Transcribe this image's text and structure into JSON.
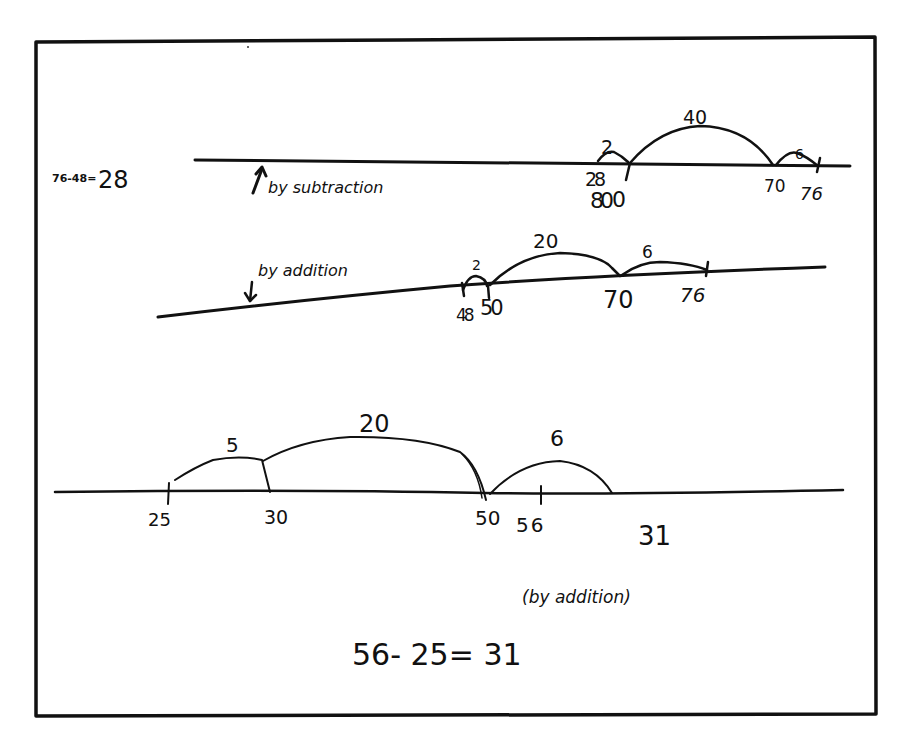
{
  "figure": {
    "frame": {
      "x": 36,
      "y": 40,
      "width": 839,
      "height": 675,
      "stroke_color": "#111111"
    },
    "ink_color": "#111111",
    "background": "#ffffff"
  },
  "section_subtraction": {
    "equation": "76-48=28",
    "equation_left": "76-48=",
    "equation_result": "28",
    "method_label": "by subtraction",
    "arrow": "up-arrow",
    "number_line": {
      "x1": 195,
      "y1": 160,
      "x2": 850,
      "y2": 166
    },
    "ticks": [
      {
        "label": "28 / 30",
        "display": "28 ",
        "sub": "30",
        "x": 610
      },
      {
        "label": "70",
        "display": "70",
        "x": 773
      },
      {
        "label": "76",
        "display": "76",
        "x": 818
      }
    ],
    "jumps": [
      {
        "label": "2",
        "from": "28",
        "to": "30"
      },
      {
        "label": "40",
        "from": "30",
        "to": "70"
      },
      {
        "label": "6",
        "from": "70",
        "to": "76"
      }
    ]
  },
  "section_addition_1": {
    "method_label": "by addition",
    "arrow": "down-arrow",
    "number_line": {
      "x1": 158,
      "y1": 317,
      "x2": 825,
      "y2": 267
    },
    "ticks": [
      {
        "label": "48 / 50",
        "display_a": "48",
        "display_b": "50"
      },
      {
        "label": "70",
        "display": "70"
      },
      {
        "label": "76",
        "display": "76"
      }
    ],
    "jumps": [
      {
        "label": "2",
        "from": "48",
        "to": "50"
      },
      {
        "label": "20",
        "from": "50",
        "to": "70"
      },
      {
        "label": "6",
        "from": "70",
        "to": "76"
      }
    ]
  },
  "section_addition_2": {
    "number_line": {
      "x1": 55,
      "y1": 492,
      "x2": 843,
      "y2": 490
    },
    "ticks": [
      {
        "label": "25",
        "x": 168
      },
      {
        "label": "30",
        "x": 270
      },
      {
        "label": "50",
        "x": 485
      },
      {
        "label": "56",
        "x": 541
      }
    ],
    "jumps": [
      {
        "label": "5",
        "from": "25",
        "to": "30"
      },
      {
        "label": "20",
        "from": "30",
        "to": "50"
      },
      {
        "label": "6",
        "from": "50",
        "to": "56"
      }
    ],
    "total": "31",
    "method_label": "(by addition)",
    "equation": "56- 25= 31"
  }
}
